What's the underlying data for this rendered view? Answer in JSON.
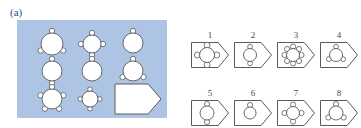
{
  "figure": {
    "background_color": "#ffffff",
    "stroke_color": "#5a5a5a",
    "fill_color": "#ffffff",
    "panel_a_background": "#adc4e5",
    "label_color": "#2f4f86"
  },
  "panel_a": {
    "label": "(a)",
    "description": "Blue plate with nine white micro-particle shapes: eight circular disks with varying numbers of small satellite lobes, and one pentagonal home-plate shape.",
    "items": [
      {
        "id": "a1",
        "shape": "circle",
        "lobes": 3,
        "cx": 52,
        "cy": 44,
        "r": 11
      },
      {
        "id": "a2",
        "shape": "circle",
        "lobes": 4,
        "cx": 92,
        "cy": 44,
        "r": 9
      },
      {
        "id": "a3",
        "shape": "circle",
        "lobes": 1,
        "cx": 133,
        "cy": 43,
        "r": 10
      },
      {
        "id": "a4",
        "shape": "circle",
        "lobes": 2,
        "cx": 52,
        "cy": 71,
        "r": 10
      },
      {
        "id": "a5",
        "shape": "circle",
        "lobes": 1,
        "cx": 92,
        "cy": 71,
        "r": 10
      },
      {
        "id": "a6",
        "shape": "circle",
        "lobes": 3,
        "cx": 133,
        "cy": 71,
        "r": 10
      },
      {
        "id": "a7",
        "shape": "circle",
        "lobes": 5,
        "cx": 52,
        "cy": 99,
        "r": 10
      },
      {
        "id": "a8",
        "shape": "circle",
        "lobes": 4,
        "cx": 90,
        "cy": 99,
        "r": 8
      },
      {
        "id": "a9",
        "shape": "pentagon-plate",
        "cx": 138,
        "cy": 99
      }
    ]
  },
  "panel_b": {
    "label": "(b)",
    "description": "Eight numbered pentagonal outline cells, each containing a circle with a different number of satellite lobes.",
    "items": [
      {
        "number": "1",
        "lobes": 4,
        "lobe_size": 3.0,
        "circle_r": 7.5
      },
      {
        "number": "2",
        "lobes": 2,
        "lobe_size": 2.4,
        "circle_r": 6.5
      },
      {
        "number": "3",
        "lobes": 8,
        "lobe_size": 2.6,
        "circle_r": 6.5
      },
      {
        "number": "4",
        "lobes": 3,
        "lobe_size": 2.4,
        "circle_r": 6.5
      },
      {
        "number": "5",
        "lobes": 2,
        "lobe_size": 2.6,
        "circle_r": 7.0
      },
      {
        "number": "6",
        "lobes": 1,
        "lobe_size": 2.6,
        "circle_r": 6.0
      },
      {
        "number": "7",
        "lobes": 4,
        "lobe_size": 2.6,
        "circle_r": 6.5
      },
      {
        "number": "8",
        "lobes": 3,
        "lobe_size": 2.6,
        "circle_r": 7.0
      }
    ],
    "rows": 2,
    "cols": 4
  }
}
